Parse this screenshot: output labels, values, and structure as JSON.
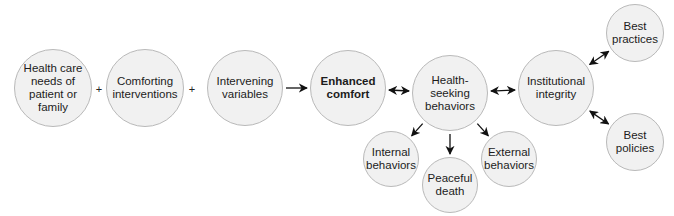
{
  "diagram": {
    "nodes": [
      {
        "id": "health-care-needs",
        "label": "Health care\nneeds of\npatient or\nfamily",
        "cx": 53,
        "cy": 88,
        "r": 39,
        "bold": false
      },
      {
        "id": "comforting-interventions",
        "label": "Comforting\ninterventions",
        "cx": 145,
        "cy": 88,
        "r": 39,
        "bold": false
      },
      {
        "id": "intervening-variables",
        "label": "Intervening\nvariables",
        "cx": 245,
        "cy": 88,
        "r": 38,
        "bold": false
      },
      {
        "id": "enhanced-comfort",
        "label": "Enhanced\ncomfort",
        "cx": 348,
        "cy": 88,
        "r": 38,
        "bold": true
      },
      {
        "id": "health-seeking-behaviors",
        "label": "Health-\nseeking\nbehaviors",
        "cx": 450,
        "cy": 93,
        "r": 38,
        "bold": false
      },
      {
        "id": "institutional-integrity",
        "label": "Institutional\nintegrity",
        "cx": 556,
        "cy": 88,
        "r": 38,
        "bold": false
      },
      {
        "id": "best-practices",
        "label": "Best\npractices",
        "cx": 635,
        "cy": 33,
        "r": 29,
        "bold": false
      },
      {
        "id": "best-policies",
        "label": "Best\npolicies",
        "cx": 635,
        "cy": 142,
        "r": 29,
        "bold": false
      },
      {
        "id": "internal-behaviors",
        "label": "Internal\nbehaviors",
        "cx": 391,
        "cy": 159,
        "r": 28,
        "bold": false
      },
      {
        "id": "peaceful-death",
        "label": "Peaceful\ndeath",
        "cx": 450,
        "cy": 185,
        "r": 28,
        "bold": false
      },
      {
        "id": "external-behaviors",
        "label": "External\nbehaviors",
        "cx": 509,
        "cy": 159,
        "r": 28,
        "bold": false
      }
    ],
    "operators": [
      {
        "symbol": "+",
        "x": 99,
        "y": 89
      },
      {
        "symbol": "+",
        "x": 192,
        "y": 89
      }
    ],
    "edges": [
      {
        "from": "intervening-variables",
        "to": "enhanced-comfort",
        "type": "one-way"
      },
      {
        "from": "enhanced-comfort",
        "to": "health-seeking-behaviors",
        "type": "two-way"
      },
      {
        "from": "health-seeking-behaviors",
        "to": "institutional-integrity",
        "type": "two-way"
      },
      {
        "from": "institutional-integrity",
        "to": "best-practices",
        "type": "two-way"
      },
      {
        "from": "institutional-integrity",
        "to": "best-policies",
        "type": "two-way"
      },
      {
        "from": "health-seeking-behaviors",
        "to": "internal-behaviors",
        "type": "one-way"
      },
      {
        "from": "health-seeking-behaviors",
        "to": "peaceful-death",
        "type": "one-way"
      },
      {
        "from": "health-seeking-behaviors",
        "to": "external-behaviors",
        "type": "one-way"
      }
    ]
  }
}
